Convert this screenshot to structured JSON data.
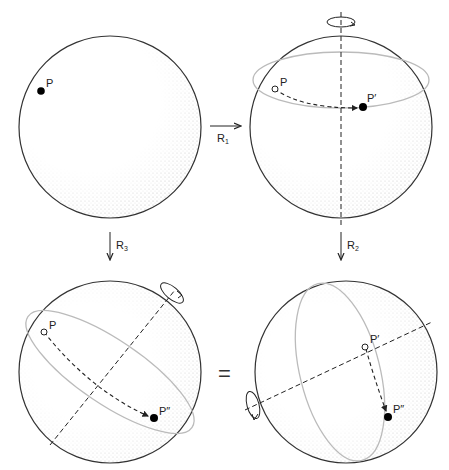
{
  "panels": [
    {
      "id": "top-left",
      "description": "Sphere with initial point P",
      "point_labels": [
        "P"
      ]
    },
    {
      "id": "top-right",
      "description": "Rotation R1 about vertical axis moves P to P'",
      "point_labels": [
        "P",
        "P′"
      ]
    },
    {
      "id": "bottom-left",
      "description": "Single rotation R3 about tilted axis moves P to P''",
      "point_labels": [
        "P",
        "P″"
      ]
    },
    {
      "id": "bottom-right",
      "description": "Rotation R2 about tilted axis moves P' to P''",
      "point_labels": [
        "P′",
        "P″"
      ]
    }
  ],
  "arrows": {
    "r1": {
      "label": "R",
      "sub": "1"
    },
    "r2": {
      "label": "R",
      "sub": "2"
    },
    "r3": {
      "label": "R",
      "sub": "3"
    }
  },
  "equals_sign": "=",
  "colors": {
    "outline": "#333333",
    "stipple": "#888888",
    "circle_path": "#bbbbbb",
    "axis": "#222222",
    "point": "#000000"
  }
}
